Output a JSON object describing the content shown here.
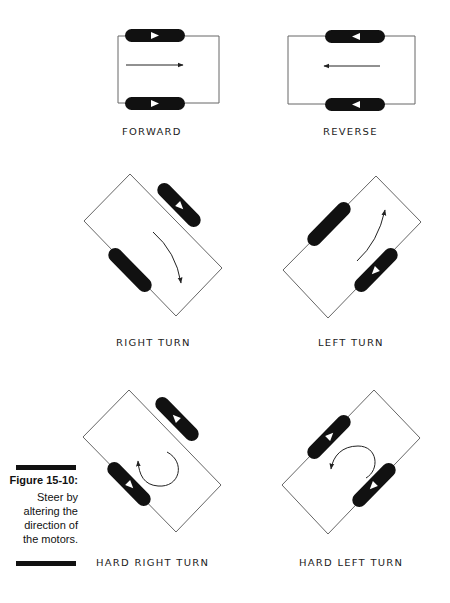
{
  "figure": {
    "number": "Figure 15-10:",
    "caption_lines": [
      "Steer by",
      "altering the",
      "direction of",
      "the motors."
    ]
  },
  "diagrams": [
    {
      "id": "forward",
      "label": "FORWARD",
      "motor_left": "forward",
      "motor_right": "forward",
      "arrow": "straight-right"
    },
    {
      "id": "reverse",
      "label": "REVERSE",
      "motor_left": "reverse",
      "motor_right": "reverse",
      "arrow": "straight-left"
    },
    {
      "id": "right-turn",
      "label": "RIGHT TURN",
      "motor_left": "off",
      "motor_right": "forward",
      "arrow": "curve-clockwise"
    },
    {
      "id": "left-turn",
      "label": "LEFT TURN",
      "motor_left": "off",
      "motor_right": "forward",
      "arrow": "curve-counterclockwise"
    },
    {
      "id": "hard-right-turn",
      "label": "HARD RIGHT TURN",
      "motor_left": "forward",
      "motor_right": "reverse",
      "arrow": "rotate-counterclockwise"
    },
    {
      "id": "hard-left-turn",
      "label": "HARD LEFT TURN",
      "motor_left": "reverse",
      "motor_right": "forward",
      "arrow": "rotate-clockwise"
    }
  ],
  "colors": {
    "ink": "#111111",
    "line": "#555555",
    "background": "#ffffff"
  }
}
